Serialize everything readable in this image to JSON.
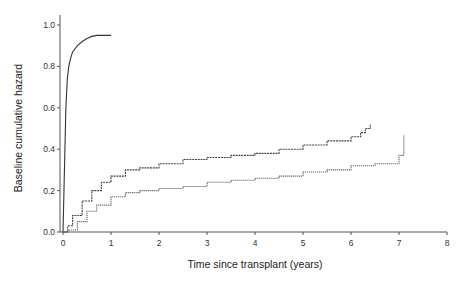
{
  "chart_data": {
    "type": "line",
    "title": "",
    "xlabel": "Time since transplant (years)",
    "ylabel": "Baseline cumulative hazard",
    "xlim": [
      0,
      8
    ],
    "ylim": [
      0,
      1.0
    ],
    "x_ticks": [
      0,
      1,
      2,
      3,
      4,
      5,
      6,
      7,
      8
    ],
    "y_ticks": [
      "0.0",
      "0.2",
      "0.4",
      "0.6",
      "0.8",
      "1.0"
    ],
    "grid": false,
    "legend": null,
    "series": [
      {
        "name": "Curve A (early, steep)",
        "style": "solid",
        "color": "#333333",
        "x": [
          0,
          0.03,
          0.06,
          0.09,
          0.12,
          0.16,
          0.2,
          0.3,
          0.4,
          0.5,
          0.6,
          0.7,
          0.8,
          0.9,
          1.0
        ],
        "y": [
          0,
          0.3,
          0.6,
          0.74,
          0.8,
          0.84,
          0.87,
          0.9,
          0.92,
          0.935,
          0.945,
          0.95,
          0.95,
          0.95,
          0.95
        ]
      },
      {
        "name": "Curve B (upper, dashed)",
        "style": "dashed",
        "color": "#444444",
        "x": [
          0,
          0.1,
          0.2,
          0.4,
          0.6,
          0.8,
          1.0,
          1.3,
          1.6,
          2.0,
          2.5,
          3.0,
          3.5,
          4.0,
          4.5,
          5.0,
          5.5,
          5.8,
          6.0,
          6.2,
          6.3,
          6.4
        ],
        "y": [
          0,
          0.03,
          0.08,
          0.15,
          0.2,
          0.24,
          0.27,
          0.3,
          0.31,
          0.33,
          0.35,
          0.36,
          0.37,
          0.38,
          0.4,
          0.42,
          0.44,
          0.44,
          0.46,
          0.48,
          0.5,
          0.52
        ]
      },
      {
        "name": "Curve C (lower, dotted)",
        "style": "dotted",
        "color": "#666666",
        "x": [
          0,
          0.1,
          0.3,
          0.5,
          0.7,
          1.0,
          1.3,
          1.6,
          2.0,
          2.5,
          3.0,
          3.5,
          4.0,
          4.5,
          5.0,
          5.5,
          6.0,
          6.5,
          7.0,
          7.1,
          7.1
        ],
        "y": [
          0,
          0.01,
          0.05,
          0.1,
          0.13,
          0.17,
          0.19,
          0.2,
          0.21,
          0.22,
          0.24,
          0.25,
          0.26,
          0.27,
          0.29,
          0.3,
          0.32,
          0.33,
          0.37,
          0.37,
          0.47
        ]
      }
    ]
  }
}
